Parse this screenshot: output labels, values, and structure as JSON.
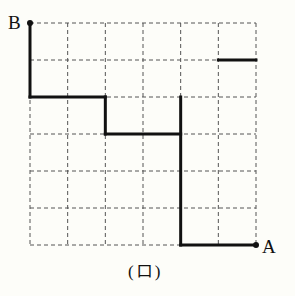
{
  "diagram": {
    "type": "grid-path",
    "grid": {
      "columns": 6,
      "rows": 6,
      "line_style": "dashed",
      "line_color": "#555555"
    },
    "points": [
      {
        "label": "B",
        "col": 0,
        "row": 0
      },
      {
        "label": "A",
        "col": 6,
        "row": 6
      }
    ],
    "path_color": "#111111",
    "segments": [
      {
        "from": [
          0,
          0
        ],
        "to": [
          0,
          2
        ]
      },
      {
        "from": [
          0,
          2
        ],
        "to": [
          2,
          2
        ]
      },
      {
        "from": [
          2,
          2
        ],
        "to": [
          2,
          3
        ]
      },
      {
        "from": [
          2,
          3
        ],
        "to": [
          4,
          3
        ]
      },
      {
        "from": [
          4,
          2
        ],
        "to": [
          4,
          6
        ]
      },
      {
        "from": [
          4,
          6
        ],
        "to": [
          6,
          6
        ]
      },
      {
        "from": [
          5,
          1
        ],
        "to": [
          6,
          1
        ]
      }
    ],
    "caption": "(ロ)"
  },
  "labels": {
    "B": "B",
    "A": "A",
    "caption": "(ロ)"
  }
}
